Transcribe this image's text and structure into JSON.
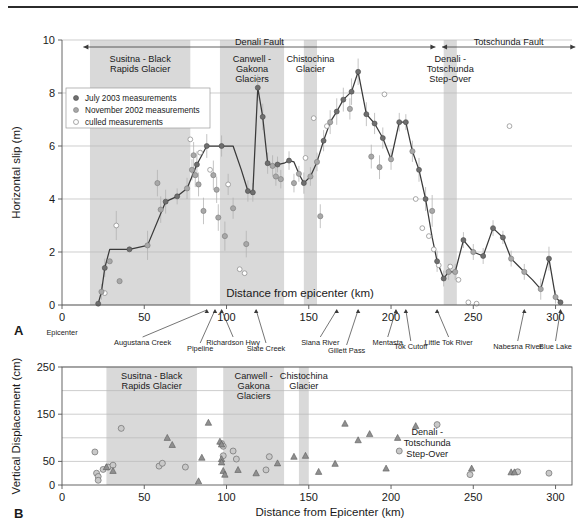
{
  "figure": {
    "panels": [
      {
        "id": "A",
        "x_label": "Distance from epicenter (km)",
        "y_label": "Horizontal slip (m)"
      },
      {
        "id": "B",
        "x_label": "Distance from Epicenter (km)",
        "y_label": "Vertical Displacement (cm)"
      }
    ]
  },
  "panelA": {
    "id": "A",
    "legend": [
      {
        "key": "july",
        "label": "July 2003 measurements"
      },
      {
        "key": "nov",
        "label": "November 2002 measurements"
      },
      {
        "key": "culled",
        "label": "culled measurements"
      }
    ],
    "fault_spans": [
      {
        "label": "Denali Fault",
        "x0": 13,
        "x1": 227
      },
      {
        "label": "Totschunda Fault",
        "x0": 231,
        "x1": 312
      }
    ],
    "bands": [
      {
        "label": "Susitna - Black\nRapids Glacier",
        "lines": [
          "Susitna - Black",
          "Rapids Glacier"
        ],
        "x0": 17,
        "x1": 78
      },
      {
        "label": "Canwell - Gakona Glaciers",
        "lines": [
          "Canwell -",
          "Gakona",
          "Glaciers"
        ],
        "x0": 96,
        "x1": 135
      },
      {
        "label": "Chistochina Glacier",
        "lines": [
          "Chistochina",
          "Glacier"
        ],
        "x0": 147,
        "x1": 155
      },
      {
        "label": "Denali - Totschunda Step-Over",
        "lines": [
          "Denali -",
          "Totschunda",
          "Step-Over"
        ],
        "x0": 232,
        "x1": 240
      }
    ],
    "sites": [
      {
        "name": "Epicenter",
        "x": 0,
        "tip": 0
      },
      {
        "name": "Augustana Creek",
        "x": 49,
        "tip": 88
      },
      {
        "name": "Pipeline",
        "x": 84,
        "tip": 93
      },
      {
        "name": "Richardson Hwy",
        "x": 104,
        "tip": 97
      },
      {
        "name": "Slate Creek",
        "x": 124,
        "tip": 118
      },
      {
        "name": "Slana River",
        "x": 157,
        "tip": 167
      },
      {
        "name": "Gillett Pass",
        "x": 173,
        "tip": 180
      },
      {
        "name": "Mentasta",
        "x": 198,
        "tip": 203
      },
      {
        "name": "Tok Cutoff",
        "x": 212,
        "tip": 209
      },
      {
        "name": "Little Tok River",
        "x": 235,
        "tip": 228
      },
      {
        "name": "Nabesna River",
        "x": 277,
        "tip": 281
      },
      {
        "name": "Blue Lake",
        "x": 300,
        "tip": 303
      }
    ]
  },
  "panelB": {
    "id": "B",
    "bands": [
      {
        "lines": [
          "Susitna - Black",
          "Rapids Glacier"
        ],
        "x0": 27,
        "x1": 82
      },
      {
        "lines": [
          "Canwell -",
          "Gakona",
          "Glaciers"
        ],
        "x0": 98,
        "x1": 135
      },
      {
        "lines": [
          "Chistochina",
          "Glacier"
        ],
        "x0": 144,
        "x1": 150
      }
    ],
    "annotations": [
      {
        "lines": [
          "Denali -",
          "Totschunda",
          "Step-Over"
        ],
        "x": 222,
        "y": 105
      }
    ]
  },
  "chart_data": [
    {
      "type": "line",
      "title": "",
      "xlabel": "Distance from epicenter (km)",
      "ylabel": "Horizontal slip (m)",
      "xlim": [
        0,
        310
      ],
      "ylim": [
        0,
        10
      ],
      "xticks": [
        0,
        50,
        100,
        150,
        200,
        250,
        300
      ],
      "yticks": [
        0,
        2,
        4,
        6,
        8,
        10
      ],
      "grid": true,
      "legend_position": "upper-left",
      "series": [
        {
          "name": "Preferred slip profile",
          "type": "line",
          "x": [
            22,
            24,
            26,
            29,
            41,
            52,
            63,
            70,
            76,
            82,
            88,
            92,
            97,
            99,
            101,
            102,
            104,
            109,
            113,
            116,
            119,
            122,
            125,
            128,
            131,
            135,
            138,
            141,
            144,
            147,
            151,
            155,
            159,
            163,
            167,
            171,
            176,
            180,
            185,
            190,
            195,
            200,
            205,
            209,
            213,
            217,
            221,
            225,
            228,
            232,
            235,
            239,
            244,
            250,
            256,
            262,
            268,
            273,
            277,
            281,
            286,
            291,
            296,
            300,
            303
          ],
          "y": [
            0.05,
            0.5,
            1.4,
            2.1,
            2.1,
            2.25,
            3.9,
            4.1,
            4.4,
            5.3,
            6.0,
            6.0,
            6.0,
            6.0,
            6.0,
            6.0,
            6.0,
            5.1,
            4.3,
            4.25,
            8.2,
            7.1,
            5.35,
            5.25,
            5.3,
            5.35,
            5.45,
            5.4,
            4.95,
            4.6,
            4.85,
            5.4,
            6.2,
            6.9,
            7.3,
            7.75,
            8.05,
            8.8,
            7.2,
            6.85,
            6.3,
            5.5,
            6.9,
            6.9,
            5.8,
            5.1,
            4.0,
            2.55,
            1.65,
            1.0,
            1.25,
            1.25,
            2.45,
            2.0,
            1.85,
            2.9,
            2.55,
            1.75,
            1.5,
            1.25,
            0.95,
            0.6,
            1.75,
            0.3,
            0.1
          ]
        },
        {
          "name": "July 2003 measurements",
          "type": "scatter",
          "points": [
            {
              "x": 22,
              "y": 0.05,
              "err": 0.0
            },
            {
              "x": 26,
              "y": 1.4,
              "err": 0.35
            },
            {
              "x": 41,
              "y": 2.1,
              "err": 0.0
            },
            {
              "x": 63,
              "y": 3.9,
              "err": 0.45
            },
            {
              "x": 70,
              "y": 4.1,
              "err": 0.3
            },
            {
              "x": 82,
              "y": 5.3,
              "err": 0.5
            },
            {
              "x": 88,
              "y": 6.0,
              "err": 0.45
            },
            {
              "x": 97,
              "y": 6.0,
              "err": 0.4
            },
            {
              "x": 113,
              "y": 4.3,
              "err": 0.4
            },
            {
              "x": 116,
              "y": 4.25,
              "err": 0.35
            },
            {
              "x": 119,
              "y": 8.2,
              "err": 0.5
            },
            {
              "x": 122,
              "y": 7.1,
              "err": 0.5
            },
            {
              "x": 125,
              "y": 5.35,
              "err": 0.4
            },
            {
              "x": 131,
              "y": 5.3,
              "err": 0.3
            },
            {
              "x": 138,
              "y": 5.45,
              "err": 0.35
            },
            {
              "x": 147,
              "y": 4.6,
              "err": 0.4
            },
            {
              "x": 159,
              "y": 6.2,
              "err": 0.4
            },
            {
              "x": 167,
              "y": 7.3,
              "err": 0.5
            },
            {
              "x": 171,
              "y": 7.75,
              "err": 0.45
            },
            {
              "x": 176,
              "y": 8.05,
              "err": 0.5
            },
            {
              "x": 180,
              "y": 8.8,
              "err": 0.5
            },
            {
              "x": 185,
              "y": 7.2,
              "err": 0.45
            },
            {
              "x": 190,
              "y": 6.85,
              "err": 0.4
            },
            {
              "x": 195,
              "y": 6.3,
              "err": 0.4
            },
            {
              "x": 205,
              "y": 6.9,
              "err": 0.35
            },
            {
              "x": 209,
              "y": 6.9,
              "err": 0.3
            },
            {
              "x": 217,
              "y": 5.1,
              "err": 0.45
            },
            {
              "x": 221,
              "y": 4.0,
              "err": 0.45
            },
            {
              "x": 228,
              "y": 1.65,
              "err": 0.4
            },
            {
              "x": 232,
              "y": 1.0,
              "err": 0.3
            },
            {
              "x": 244,
              "y": 2.45,
              "err": 0.3
            },
            {
              "x": 256,
              "y": 1.85,
              "err": 0.3
            },
            {
              "x": 262,
              "y": 2.9,
              "err": 0.3
            },
            {
              "x": 268,
              "y": 2.55,
              "err": 0.25
            },
            {
              "x": 296,
              "y": 1.75,
              "err": 0.45
            },
            {
              "x": 303,
              "y": 0.1,
              "err": 0.0
            }
          ]
        },
        {
          "name": "November 2002 measurements",
          "type": "scatter",
          "points": [
            {
              "x": 24,
              "y": 0.5,
              "err": 0.3
            },
            {
              "x": 29,
              "y": 1.65,
              "err": 0.0
            },
            {
              "x": 35,
              "y": 0.9,
              "err": 0.0
            },
            {
              "x": 52,
              "y": 2.25,
              "err": 0.55
            },
            {
              "x": 58,
              "y": 4.6,
              "err": 0.5
            },
            {
              "x": 60,
              "y": 3.6,
              "err": 0.5
            },
            {
              "x": 76,
              "y": 4.4,
              "err": 0.4
            },
            {
              "x": 79,
              "y": 5.1,
              "err": 0.4
            },
            {
              "x": 80,
              "y": 5.65,
              "err": 0.5
            },
            {
              "x": 81,
              "y": 4.9,
              "err": 0.45
            },
            {
              "x": 83,
              "y": 4.55,
              "err": 0.45
            },
            {
              "x": 86,
              "y": 3.55,
              "err": 0.5
            },
            {
              "x": 92,
              "y": 4.9,
              "err": 0.55
            },
            {
              "x": 94,
              "y": 4.35,
              "err": 0.5
            },
            {
              "x": 95,
              "y": 3.3,
              "err": 0.5
            },
            {
              "x": 99,
              "y": 2.6,
              "err": 0.55
            },
            {
              "x": 104,
              "y": 3.65,
              "err": 0.4
            },
            {
              "x": 112,
              "y": 2.3,
              "err": 0.5
            },
            {
              "x": 128,
              "y": 5.25,
              "err": 0.4
            },
            {
              "x": 130,
              "y": 4.85,
              "err": 0.35
            },
            {
              "x": 133,
              "y": 4.75,
              "err": 0.35
            },
            {
              "x": 141,
              "y": 4.6,
              "err": 0.35
            },
            {
              "x": 144,
              "y": 4.95,
              "err": 0.3
            },
            {
              "x": 151,
              "y": 4.85,
              "err": 0.35
            },
            {
              "x": 155,
              "y": 5.4,
              "err": 0.35
            },
            {
              "x": 157,
              "y": 3.35,
              "err": 0.45
            },
            {
              "x": 163,
              "y": 6.9,
              "err": 0.45
            },
            {
              "x": 175,
              "y": 7.4,
              "err": 0.4
            },
            {
              "x": 188,
              "y": 5.6,
              "err": 0.45
            },
            {
              "x": 193,
              "y": 5.2,
              "err": 0.45
            },
            {
              "x": 200,
              "y": 5.5,
              "err": 0.4
            },
            {
              "x": 213,
              "y": 5.8,
              "err": 0.4
            },
            {
              "x": 225,
              "y": 3.55,
              "err": 0.6
            },
            {
              "x": 235,
              "y": 1.25,
              "err": 0.3
            },
            {
              "x": 239,
              "y": 1.25,
              "err": 0.3
            },
            {
              "x": 250,
              "y": 2.0,
              "err": 0.3
            },
            {
              "x": 273,
              "y": 1.75,
              "err": 0.3
            },
            {
              "x": 281,
              "y": 1.25,
              "err": 0.3
            },
            {
              "x": 291,
              "y": 0.6,
              "err": 0.4
            },
            {
              "x": 300,
              "y": 0.3,
              "err": 0.25
            }
          ]
        },
        {
          "name": "culled measurements",
          "type": "scatter",
          "points": [
            {
              "x": 26,
              "y": 0.45,
              "err": 0.0
            },
            {
              "x": 33,
              "y": 3.0,
              "err": 0.55
            },
            {
              "x": 78,
              "y": 6.25,
              "err": 0.0
            },
            {
              "x": 84,
              "y": 5.75,
              "err": 0.0
            },
            {
              "x": 90,
              "y": 5.1,
              "err": 0.0
            },
            {
              "x": 101,
              "y": 4.55,
              "err": 0.4
            },
            {
              "x": 108,
              "y": 1.35,
              "err": 0.0
            },
            {
              "x": 111,
              "y": 1.2,
              "err": 0.0
            },
            {
              "x": 148,
              "y": 5.55,
              "err": 0.0
            },
            {
              "x": 153,
              "y": 7.05,
              "err": 0.0
            },
            {
              "x": 161,
              "y": 6.75,
              "err": 0.0
            },
            {
              "x": 196,
              "y": 7.95,
              "err": 0.0
            },
            {
              "x": 219,
              "y": 2.9,
              "err": 0.0
            },
            {
              "x": 223,
              "y": 2.6,
              "err": 0.0
            },
            {
              "x": 226,
              "y": 2.1,
              "err": 0.0
            },
            {
              "x": 229,
              "y": 1.5,
              "err": 0.0
            },
            {
              "x": 236,
              "y": 1.45,
              "err": 0.0
            },
            {
              "x": 241,
              "y": 0.95,
              "err": 0.0
            },
            {
              "x": 247,
              "y": 0.1,
              "err": 0.0
            },
            {
              "x": 252,
              "y": 0.05,
              "err": 0.0
            },
            {
              "x": 215,
              "y": 4.0,
              "err": 0.0
            },
            {
              "x": 272,
              "y": 6.75,
              "err": 0.0
            }
          ]
        }
      ]
    },
    {
      "type": "scatter",
      "title": "",
      "xlabel": "Distance from Epicenter (km)",
      "ylabel": "Vertical Displacement (cm)",
      "xlim": [
        0,
        310
      ],
      "ylim": [
        0,
        250
      ],
      "xticks": [
        0,
        50,
        100,
        150,
        200,
        250,
        300
      ],
      "yticks": [
        0,
        50,
        150,
        250
      ],
      "gridlines_y": [
        50,
        100,
        150,
        200,
        250
      ],
      "grid": true,
      "series": [
        {
          "name": "circle-measurements",
          "marker": "circle",
          "x": [
            20,
            21,
            22,
            22,
            25,
            28,
            31,
            36,
            59,
            61,
            75,
            97,
            98,
            98,
            104,
            106,
            124,
            126,
            205,
            228,
            248,
            277,
            296
          ],
          "y": [
            70,
            25,
            18,
            10,
            33,
            38,
            42,
            120,
            40,
            46,
            38,
            88,
            82,
            62,
            72,
            55,
            32,
            60,
            72,
            128,
            22,
            28,
            25
          ]
        },
        {
          "name": "triangle-measurements",
          "marker": "triangle",
          "x": [
            27,
            31,
            64,
            67,
            83,
            85,
            89,
            96,
            97,
            97,
            97,
            98,
            99,
            107,
            118,
            131,
            141,
            148,
            156,
            166,
            172,
            180,
            187,
            197,
            204,
            215,
            249,
            273,
            275
          ],
          "y": [
            38,
            30,
            100,
            85,
            8,
            58,
            132,
            92,
            86,
            55,
            48,
            30,
            22,
            32,
            25,
            46,
            60,
            62,
            28,
            45,
            130,
            95,
            108,
            35,
            100,
            125,
            35,
            27,
            27
          ]
        }
      ]
    }
  ]
}
